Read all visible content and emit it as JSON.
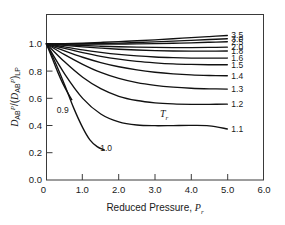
{
  "chart_data": {
    "type": "line",
    "title": "",
    "xlabel": "Reduced Pressure, Pr",
    "ylabel": "DABP/(DABP)LP",
    "xlim": [
      0,
      6.0
    ],
    "ylim": [
      0.0,
      1.0
    ],
    "grid": false,
    "legend_position": "right-of-curves (inline end labels)",
    "legend_title": "Tr",
    "x_ticks": [
      "0",
      "1.0",
      "2.0",
      "3.0",
      "4.0",
      "5.0",
      "6.0"
    ],
    "y_ticks": [
      "0.0",
      "0.2",
      "0.4",
      "0.6",
      "0.8",
      "1.0"
    ],
    "annotations": [
      {
        "text": "Tr",
        "x": 3.25,
        "y": 0.46
      },
      {
        "text": "0.9",
        "x": 0.45,
        "y": 0.49
      },
      {
        "text": "1.0",
        "x": 1.65,
        "y": 0.215
      }
    ],
    "series": [
      {
        "name": "3.5",
        "label": "3.5",
        "x": [
          0,
          0.5,
          1.0,
          1.5,
          2.0,
          2.5,
          3.0,
          3.5,
          4.0,
          4.5,
          5.0
        ],
        "values": [
          1.0,
          1.002,
          1.006,
          1.011,
          1.017,
          1.023,
          1.03,
          1.038,
          1.046,
          1.054,
          1.062
        ]
      },
      {
        "name": "3.0",
        "label": "3.0",
        "x": [
          0,
          0.5,
          1.0,
          1.5,
          2.0,
          2.5,
          3.0,
          3.5,
          4.0,
          4.5,
          5.0
        ],
        "values": [
          1.0,
          1.0,
          1.001,
          1.003,
          1.006,
          1.01,
          1.015,
          1.02,
          1.026,
          1.032,
          1.038
        ]
      },
      {
        "name": "2.5",
        "label": "2.5",
        "x": [
          0,
          0.5,
          1.0,
          1.5,
          2.0,
          2.5,
          3.0,
          3.5,
          4.0,
          4.5,
          5.0
        ],
        "values": [
          1.0,
          0.999,
          0.998,
          0.998,
          0.999,
          1.0,
          1.002,
          1.005,
          1.008,
          1.012,
          1.016
        ]
      },
      {
        "name": "2.0",
        "label": "2.0",
        "x": [
          0,
          0.5,
          1.0,
          1.5,
          2.0,
          2.5,
          3.0,
          3.5,
          4.0,
          4.5,
          5.0
        ],
        "values": [
          1.0,
          0.994,
          0.988,
          0.983,
          0.979,
          0.976,
          0.974,
          0.973,
          0.973,
          0.974,
          0.976
        ]
      },
      {
        "name": "1.8",
        "label": "1.8",
        "x": [
          0,
          0.5,
          1.0,
          1.5,
          2.0,
          2.5,
          3.0,
          3.5,
          4.0,
          4.5,
          5.0
        ],
        "values": [
          1.0,
          0.989,
          0.978,
          0.969,
          0.961,
          0.955,
          0.951,
          0.948,
          0.947,
          0.947,
          0.948
        ]
      },
      {
        "name": "1.6",
        "label": "1.6",
        "x": [
          0,
          0.5,
          1.0,
          1.5,
          2.0,
          2.5,
          3.0,
          3.5,
          4.0,
          4.5,
          5.0
        ],
        "values": [
          1.0,
          0.978,
          0.956,
          0.938,
          0.923,
          0.912,
          0.904,
          0.899,
          0.896,
          0.895,
          0.896
        ]
      },
      {
        "name": "1.5",
        "label": "1.5",
        "x": [
          0,
          0.5,
          1.0,
          1.5,
          2.0,
          2.5,
          3.0,
          3.5,
          4.0,
          4.5,
          5.0
        ],
        "values": [
          1.0,
          0.967,
          0.936,
          0.909,
          0.888,
          0.872,
          0.861,
          0.853,
          0.849,
          0.847,
          0.847
        ]
      },
      {
        "name": "1.4",
        "label": "1.4",
        "x": [
          0,
          0.5,
          1.0,
          1.5,
          2.0,
          2.5,
          3.0,
          3.5,
          4.0,
          4.5,
          5.0
        ],
        "values": [
          1.0,
          0.949,
          0.902,
          0.863,
          0.832,
          0.809,
          0.792,
          0.78,
          0.772,
          0.768,
          0.766
        ]
      },
      {
        "name": "1.3",
        "label": "1.3",
        "x": [
          0,
          0.5,
          1.0,
          1.5,
          2.0,
          2.5,
          3.0,
          3.5,
          4.0,
          4.5,
          5.0
        ],
        "values": [
          1.0,
          0.921,
          0.85,
          0.79,
          0.746,
          0.715,
          0.695,
          0.682,
          0.674,
          0.67,
          0.668
        ]
      },
      {
        "name": "1.2",
        "label": "1.2",
        "x": [
          0,
          0.5,
          1.0,
          1.5,
          2.0,
          2.5,
          3.0,
          3.5,
          4.0,
          4.5,
          5.0
        ],
        "values": [
          1.0,
          0.868,
          0.755,
          0.671,
          0.615,
          0.584,
          0.567,
          0.559,
          0.556,
          0.556,
          0.557
        ]
      },
      {
        "name": "1.1",
        "label": "1.1",
        "x": [
          0,
          0.5,
          1.0,
          1.5,
          2.0,
          2.5,
          3.0,
          3.5,
          4.0,
          4.5,
          5.0
        ],
        "values": [
          1.0,
          0.78,
          0.6,
          0.485,
          0.427,
          0.404,
          0.399,
          0.4,
          0.401,
          0.398,
          0.375
        ]
      },
      {
        "name": "1.0",
        "label": "1.0",
        "x": [
          0,
          0.25,
          0.5,
          0.75,
          1.0,
          1.2,
          1.4,
          1.6
        ],
        "values": [
          1.0,
          0.86,
          0.7,
          0.53,
          0.385,
          0.295,
          0.245,
          0.22
        ]
      },
      {
        "name": "0.9",
        "label": "0.9",
        "x": [
          0,
          0.15,
          0.3,
          0.45,
          0.6,
          0.7
        ],
        "values": [
          1.0,
          0.9,
          0.8,
          0.71,
          0.635,
          0.59
        ]
      }
    ]
  },
  "axes": {
    "x_title_main": "Reduced Pressure, ",
    "x_title_var": "P",
    "x_title_sub": "r",
    "y_title_d": "D",
    "y_title_ab": "AB",
    "y_title_p": "P",
    "y_title_slash": "/(",
    "y_title_d2": "D",
    "y_title_ab2": "AB",
    "y_title_p2": "P",
    "y_title_close": ")",
    "y_title_lp": "LP"
  },
  "colors": {
    "curve": "#111111",
    "frame": "#3a3a3a",
    "text": "#1a1a1a",
    "background": "#ffffff"
  }
}
